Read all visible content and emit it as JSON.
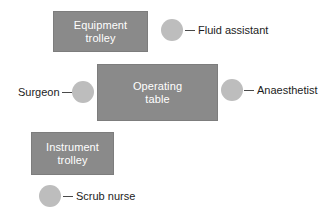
{
  "diagram": {
    "background_color": "#ffffff",
    "box_fill_color": "#8a8a8a",
    "box_text_color": "#ffffff",
    "circle_fill_color": "#bdbdbd",
    "label_text_color": "#1c1c1c",
    "leader_line_color": "#4a4a4a",
    "boxes": [
      {
        "id": "equipment-trolley",
        "label": "Equipment\ntrolley",
        "x": 53,
        "y": 11,
        "width": 95,
        "height": 41
      },
      {
        "id": "operating-table",
        "label": "Operating\ntable",
        "x": 97,
        "y": 64,
        "width": 121,
        "height": 57
      },
      {
        "id": "instrument-trolley",
        "label": "Instrument\ntrolley",
        "x": 31,
        "y": 132,
        "width": 83,
        "height": 43
      }
    ],
    "people": [
      {
        "id": "fluid-assistant",
        "label": "Fluid assistant",
        "circle_cx": 172,
        "circle_cy": 30,
        "circle_r": 11,
        "leader_x": 185,
        "leader_y": 30,
        "leader_w": 10,
        "label_x": 198,
        "label_y": 24,
        "label_align": "left"
      },
      {
        "id": "surgeon",
        "label": "Surgeon",
        "circle_cx": 83,
        "circle_cy": 92,
        "circle_r": 11,
        "leader_x": 62,
        "leader_y": 92,
        "leader_w": 10,
        "label_x": 18,
        "label_y": 86,
        "label_align": "left"
      },
      {
        "id": "anaesthetist",
        "label": "Anaesthetist",
        "circle_cx": 232,
        "circle_cy": 90,
        "circle_r": 11,
        "leader_x": 244,
        "leader_y": 90,
        "leader_w": 10,
        "label_x": 257,
        "label_y": 84,
        "label_align": "left"
      },
      {
        "id": "scrub-nurse",
        "label": "Scrub nurse",
        "circle_cx": 50,
        "circle_cy": 196,
        "circle_r": 11,
        "leader_x": 63,
        "leader_y": 196,
        "leader_w": 10,
        "label_x": 76,
        "label_y": 190,
        "label_align": "left"
      }
    ]
  }
}
